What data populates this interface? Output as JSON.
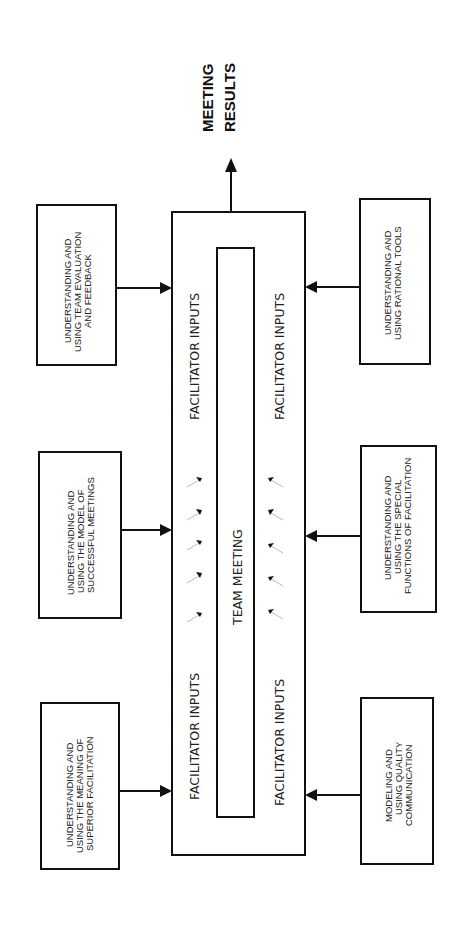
{
  "output": {
    "line1": "MEETING",
    "line2": "RESULTS"
  },
  "center": {
    "team_meeting": "TEAM MEETING",
    "facilitator_inputs": "FACILITATOR INPUTS"
  },
  "left_boxes": [
    {
      "lines": [
        "UNDERSTANDING AND",
        "USING TEAM EVALUATION",
        "AND FEEDBACK"
      ]
    },
    {
      "lines": [
        "UNDERSTANDING AND",
        "USING THE MODEL OF",
        "SUCCESSFUL MEETINGS"
      ]
    },
    {
      "lines": [
        "UNDERSTANDING AND",
        "USING THE MEANING OF",
        "SUPERIOR FACILITATION"
      ]
    }
  ],
  "right_boxes": [
    {
      "lines": [
        "UNDERSTANDING AND",
        "USING RATIONAL TOOLS"
      ]
    },
    {
      "lines": [
        "UNDERSTANDING AND",
        "USING THE SPECIAL",
        "FUNCTIONS OF FACILITATION"
      ]
    },
    {
      "lines": [
        "MODELING AND",
        "USING QUALITY",
        "COMMUNICATION"
      ]
    }
  ],
  "colors": {
    "stroke": "#111111",
    "background": "#ffffff"
  }
}
